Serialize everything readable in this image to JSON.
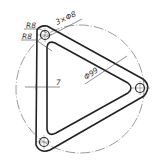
{
  "drawing": {
    "type": "engineering-drawing",
    "subject": "triangular link plate with three holes",
    "stroke_color": "#222222",
    "background": "#ffffff",
    "dimensions": {
      "fillet_outer": "R8",
      "fillet_inner": "R8",
      "holes": "3×Φ8",
      "pitch_circle": "Φ99",
      "wall_width": "7"
    },
    "holes": [
      {
        "name": "top-left",
        "cx": 45,
        "cy": 35
      },
      {
        "name": "right",
        "cx": 140,
        "cy": 88
      },
      {
        "name": "bottom-left",
        "cx": 44,
        "cy": 142
      }
    ]
  }
}
